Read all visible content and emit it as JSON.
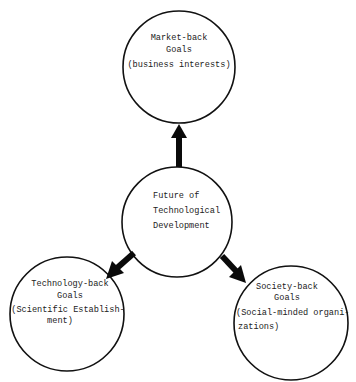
{
  "diagram": {
    "type": "hub-and-spoke",
    "colors": {
      "background": "#ffffff",
      "stroke": "#111111",
      "arrow": "#0a0a0a",
      "text": "#222222"
    },
    "center": {
      "lines": [
        "Future of",
        "Technological",
        "Development"
      ]
    },
    "nodes": {
      "market": {
        "title": [
          "Market-back",
          "Goals"
        ],
        "subtitle": [
          "(business interests)"
        ]
      },
      "technology": {
        "title": [
          "Technology-back",
          "Goals"
        ],
        "subtitle": [
          "(Scientific Establish-",
          "ment)"
        ]
      },
      "society": {
        "title": [
          "Society-back",
          "Goals"
        ],
        "subtitle": [
          "(Social-minded organi-",
          "zations)"
        ]
      }
    },
    "edges": [
      {
        "from": "center",
        "to": "market",
        "direction": "up"
      },
      {
        "from": "center",
        "to": "technology",
        "direction": "down-left"
      },
      {
        "from": "center",
        "to": "society",
        "direction": "down-right"
      }
    ]
  }
}
